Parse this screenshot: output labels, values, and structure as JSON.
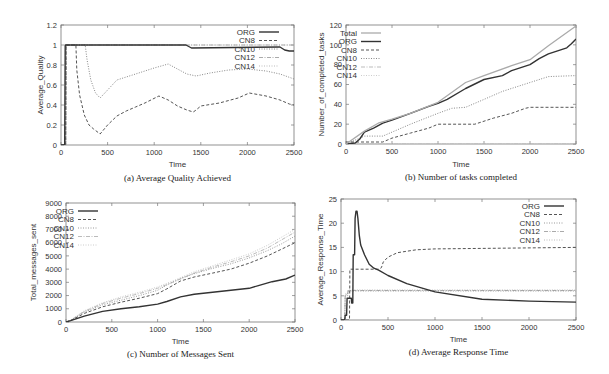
{
  "chart_data": [
    {
      "id": "a",
      "type": "line",
      "caption": "(a) Average Quality Achieved",
      "xlabel": "Time",
      "ylabel": "Average_Quality",
      "xlim": [
        0,
        2500
      ],
      "ylim": [
        0,
        1.2
      ],
      "xticks": [
        0,
        500,
        1000,
        1500,
        2000,
        2500
      ],
      "yticks": [
        0,
        0.2,
        0.4,
        0.6,
        0.8,
        1,
        1.2
      ],
      "ytick_labels": [
        "0",
        "0.2",
        "0.4",
        "0.6",
        "0.8",
        "1",
        "1.2"
      ],
      "legend_position": "top-right",
      "legend": [
        "ORG",
        "CN8",
        "CN10",
        "CN12",
        "CN14"
      ],
      "series": [
        {
          "name": "ORG",
          "style": "solid",
          "color": "#333333",
          "width": 1.4,
          "x": [
            0,
            40,
            45,
            1340,
            1360,
            1400,
            2350,
            2400,
            2450,
            2500
          ],
          "y": [
            0,
            0,
            1,
            1,
            0.99,
            0.97,
            0.98,
            0.95,
            0.94,
            0.94
          ]
        },
        {
          "name": "CN8",
          "style": "dashed",
          "color": "#555555",
          "width": 1,
          "x": [
            0,
            50,
            55,
            160,
            170,
            200,
            250,
            300,
            350,
            420,
            500,
            600,
            700,
            800,
            900,
            1050,
            1150,
            1250,
            1350,
            1420,
            1450,
            1500,
            1700,
            1900,
            2020,
            2200,
            2350,
            2450,
            2500
          ],
          "y": [
            0,
            0,
            1,
            1,
            0.75,
            0.5,
            0.3,
            0.2,
            0.16,
            0.11,
            0.2,
            0.29,
            0.34,
            0.38,
            0.42,
            0.49,
            0.45,
            0.39,
            0.35,
            0.33,
            0.35,
            0.39,
            0.42,
            0.47,
            0.52,
            0.49,
            0.45,
            0.41,
            0.4
          ]
        },
        {
          "name": "CN10",
          "style": "dotted",
          "color": "#888888",
          "width": 1,
          "x": [
            0,
            50,
            55,
            260,
            280,
            320,
            370,
            420,
            500,
            600,
            800,
            1000,
            1150,
            1250,
            1350,
            1450,
            1600,
            1800,
            2000,
            2200,
            2350,
            2500
          ],
          "y": [
            0,
            0,
            1,
            1,
            0.85,
            0.65,
            0.52,
            0.47,
            0.55,
            0.65,
            0.71,
            0.77,
            0.81,
            0.76,
            0.71,
            0.69,
            0.72,
            0.75,
            0.76,
            0.74,
            0.71,
            0.66
          ]
        },
        {
          "name": "CN12",
          "style": "dashdot",
          "color": "#aaaaaa",
          "width": 1,
          "x": [
            0,
            50,
            55,
            2500
          ],
          "y": [
            0,
            0,
            1,
            1
          ]
        },
        {
          "name": "CN14",
          "style": "dotted",
          "color": "#bbbbbb",
          "width": 1,
          "x": [
            0,
            50,
            55,
            2500
          ],
          "y": [
            0,
            0,
            1,
            1
          ]
        }
      ]
    },
    {
      "id": "b",
      "type": "line",
      "caption": "(b) Number of tasks completed",
      "xlabel": "Time",
      "ylabel": "Number_of_completed_tasks",
      "xlim": [
        0,
        2500
      ],
      "ylim": [
        0,
        120
      ],
      "xticks": [
        0,
        500,
        1000,
        1500,
        2000,
        2500
      ],
      "yticks": [
        0,
        20,
        40,
        60,
        80,
        100,
        120
      ],
      "ytick_labels": [
        "0",
        "20",
        "40",
        "60",
        "80",
        "100",
        "120"
      ],
      "legend_position": "top-left",
      "legend": [
        "Total",
        "ORG",
        "CN8",
        "CN10",
        "CN12",
        "CN14"
      ],
      "series": [
        {
          "name": "Total",
          "style": "solid",
          "color": "#aaaaaa",
          "width": 1.3,
          "x": [
            0,
            200,
            350,
            500,
            700,
            1000,
            1300,
            1500,
            1800,
            2000,
            2200,
            2500
          ],
          "y": [
            0,
            13,
            21,
            25,
            31,
            42,
            62,
            69,
            79,
            85,
            99,
            119
          ]
        },
        {
          "name": "ORG",
          "style": "solid",
          "color": "#333333",
          "width": 1.4,
          "x": [
            0,
            100,
            150,
            200,
            300,
            400,
            500,
            700,
            900,
            1000,
            1100,
            1300,
            1500,
            1700,
            1800,
            2000,
            2100,
            2200,
            2300,
            2400,
            2450,
            2500
          ],
          "y": [
            0,
            1,
            5,
            12,
            16,
            21,
            24,
            31,
            38,
            41,
            45,
            56,
            65,
            69,
            74,
            80,
            86,
            91,
            94,
            97,
            101,
            106
          ]
        },
        {
          "name": "CN8",
          "style": "dashed",
          "color": "#555555",
          "width": 1,
          "x": [
            0,
            400,
            500,
            700,
            900,
            1000,
            1400,
            1600,
            1800,
            1950,
            2000,
            2500
          ],
          "y": [
            2,
            2,
            6,
            11,
            16,
            20,
            20,
            26,
            31,
            36,
            37,
            37
          ]
        },
        {
          "name": "CN10",
          "style": "dotted",
          "color": "#888888",
          "width": 1,
          "x": [
            0,
            200,
            400,
            700,
            1000,
            1150,
            1300,
            1500,
            1700,
            2000,
            2200,
            2500
          ],
          "y": [
            0,
            8,
            8,
            20,
            31,
            36,
            37,
            45,
            53,
            62,
            68,
            69
          ]
        },
        {
          "name": "CN12",
          "style": "dashdot",
          "color": "#bbbbbb",
          "width": 1,
          "x": [
            0,
            2500
          ],
          "y": [
            0,
            0
          ]
        },
        {
          "name": "CN14",
          "style": "dotted",
          "color": "#cccccc",
          "width": 1,
          "x": [
            0,
            2500
          ],
          "y": [
            0,
            0
          ]
        }
      ]
    },
    {
      "id": "c",
      "type": "line",
      "caption": "(c) Number of Messages Sent",
      "xlabel": "Time",
      "ylabel": "Total_messages_sent",
      "xlim": [
        0,
        2500
      ],
      "ylim": [
        0,
        9000
      ],
      "xticks": [
        0,
        500,
        1000,
        1500,
        2000,
        2500
      ],
      "yticks": [
        0,
        1000,
        2000,
        3000,
        4000,
        5000,
        6000,
        7000,
        8000,
        9000
      ],
      "ytick_labels": [
        "0",
        "1000",
        "2000",
        "3000",
        "4000",
        "5000",
        "6000",
        "7000",
        "8000",
        "9000"
      ],
      "legend_position": "top-left",
      "legend": [
        "ORG",
        "CN8",
        "CN10",
        "CN12",
        "CN14"
      ],
      "series": [
        {
          "name": "ORG",
          "style": "solid",
          "color": "#333333",
          "width": 1.4,
          "x": [
            0,
            50,
            200,
            400,
            600,
            800,
            1000,
            1100,
            1250,
            1400,
            1600,
            1800,
            2000,
            2100,
            2250,
            2400,
            2500
          ],
          "y": [
            0,
            100,
            450,
            800,
            1000,
            1150,
            1350,
            1550,
            1900,
            2100,
            2250,
            2400,
            2550,
            2750,
            3050,
            3250,
            3550
          ]
        },
        {
          "name": "CN8",
          "style": "dashed",
          "color": "#555555",
          "width": 1,
          "x": [
            0,
            50,
            200,
            400,
            600,
            800,
            1000,
            1100,
            1250,
            1400,
            1600,
            1800,
            2000,
            2200,
            2350,
            2500
          ],
          "y": [
            0,
            100,
            650,
            1150,
            1500,
            1800,
            2150,
            2500,
            3100,
            3400,
            3700,
            4000,
            4450,
            5000,
            5500,
            6000
          ]
        },
        {
          "name": "CN10",
          "style": "dotted",
          "color": "#999999",
          "width": 1,
          "x": [
            0,
            50,
            200,
            400,
            600,
            800,
            1000,
            1100,
            1250,
            1400,
            1600,
            1800,
            2000,
            2200,
            2350,
            2500
          ],
          "y": [
            0,
            120,
            750,
            1300,
            1650,
            2000,
            2400,
            2800,
            3300,
            3650,
            4050,
            4400,
            4850,
            5400,
            5900,
            6500
          ]
        },
        {
          "name": "CN12",
          "style": "dashdot",
          "color": "#bbbbbb",
          "width": 1,
          "x": [
            0,
            50,
            200,
            400,
            600,
            800,
            1000,
            1200,
            1400,
            1600,
            1800,
            2000,
            2200,
            2500
          ],
          "y": [
            0,
            130,
            800,
            1400,
            1800,
            2150,
            2550,
            3100,
            3700,
            4150,
            4550,
            5000,
            5600,
            6800
          ]
        },
        {
          "name": "CN14",
          "style": "dotted",
          "color": "#cccccc",
          "width": 1,
          "x": [
            0,
            50,
            200,
            400,
            600,
            800,
            1000,
            1200,
            1400,
            1600,
            1800,
            2000,
            2200,
            2500
          ],
          "y": [
            0,
            140,
            850,
            1450,
            1900,
            2250,
            2650,
            3200,
            3800,
            4250,
            4700,
            5150,
            5800,
            7000
          ]
        }
      ]
    },
    {
      "id": "d",
      "type": "line",
      "caption": "(d) Average Response Time",
      "xlabel": "Time",
      "ylabel": "Average_Response_Time",
      "xlim": [
        0,
        2500
      ],
      "ylim": [
        0,
        25
      ],
      "xticks": [
        0,
        500,
        1000,
        1500,
        2000,
        2500
      ],
      "yticks": [
        0,
        5,
        10,
        15,
        20,
        25
      ],
      "ytick_labels": [
        "0",
        "5",
        "10",
        "15",
        "20",
        "25"
      ],
      "legend_position": "top-right",
      "legend": [
        "ORG",
        "CN8",
        "CN10",
        "CN12",
        "CN14"
      ],
      "series": [
        {
          "name": "ORG",
          "style": "solid",
          "color": "#333333",
          "width": 1.4,
          "x": [
            0,
            40,
            45,
            60,
            65,
            80,
            85,
            110,
            115,
            125,
            130,
            145,
            150,
            160,
            170,
            180,
            195,
            210,
            250,
            300,
            350,
            400,
            500,
            700,
            1000,
            1500,
            2000,
            2500
          ],
          "y": [
            0,
            0,
            1,
            1,
            4.5,
            4.5,
            4.5,
            4.5,
            3.5,
            3.5,
            13.5,
            13.5,
            21,
            22.5,
            22.5,
            21,
            17.5,
            15.5,
            13.5,
            11.5,
            10.7,
            10.3,
            9.2,
            7.5,
            5.8,
            4.3,
            3.9,
            3.7
          ]
        },
        {
          "name": "CN8",
          "style": "dashed",
          "color": "#555555",
          "width": 1,
          "x": [
            0,
            90,
            95,
            400,
            430,
            450,
            500,
            600,
            800,
            1000,
            1500,
            2000,
            2500
          ],
          "y": [
            0,
            0,
            10.5,
            10.5,
            10.8,
            12.0,
            13.0,
            13.9,
            14.5,
            14.7,
            14.8,
            14.9,
            15.0
          ]
        },
        {
          "name": "CN10",
          "style": "dotted",
          "color": "#999999",
          "width": 1,
          "x": [
            0,
            40,
            45,
            70,
            75,
            2500
          ],
          "y": [
            0,
            0,
            5,
            5,
            6,
            6
          ]
        },
        {
          "name": "CN12",
          "style": "dashdot",
          "color": "#aaaaaa",
          "width": 1,
          "x": [
            0,
            40,
            45,
            70,
            75,
            2500
          ],
          "y": [
            0,
            0,
            5.2,
            5.2,
            6.1,
            6.1
          ]
        },
        {
          "name": "CN14",
          "style": "dotted",
          "color": "#bbbbbb",
          "width": 1,
          "x": [
            0,
            40,
            45,
            70,
            75,
            2500
          ],
          "y": [
            0,
            0,
            5.4,
            5.4,
            6.2,
            6.2
          ]
        }
      ]
    }
  ],
  "layout": {
    "panels": [
      {
        "id": "a",
        "left": 61,
        "right": 294,
        "top": 25,
        "bottom": 145,
        "legend_x": 255,
        "legend_y": 32,
        "caption_y": 181,
        "xlabel_y": 167
      },
      {
        "id": "b",
        "left": 346,
        "right": 576,
        "top": 25,
        "bottom": 144,
        "legend_x": 357,
        "legend_y": 33,
        "caption_y": 180,
        "xlabel_y": 167
      },
      {
        "id": "c",
        "left": 66,
        "right": 295,
        "top": 203,
        "bottom": 322,
        "legend_x": 74,
        "legend_y": 211,
        "caption_y": 357,
        "xlabel_y": 344
      },
      {
        "id": "d",
        "left": 341,
        "right": 576,
        "top": 199,
        "bottom": 320,
        "legend_x": 540,
        "legend_y": 206,
        "caption_y": 355,
        "xlabel_y": 342
      }
    ]
  }
}
